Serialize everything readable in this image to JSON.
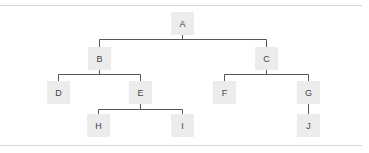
{
  "diagram": {
    "type": "tree",
    "colors": {
      "node_fill": "#ececec",
      "node_text": "#444444",
      "edge": "#555555",
      "separator": "#d8d8d8"
    },
    "nodes": [
      {
        "id": "A",
        "label": "A",
        "x": 171,
        "y": 12
      },
      {
        "id": "B",
        "label": "B",
        "x": 88,
        "y": 47
      },
      {
        "id": "C",
        "label": "C",
        "x": 255,
        "y": 47
      },
      {
        "id": "D",
        "label": "D",
        "x": 47,
        "y": 81
      },
      {
        "id": "E",
        "label": "E",
        "x": 129,
        "y": 81
      },
      {
        "id": "F",
        "label": "F",
        "x": 213,
        "y": 81
      },
      {
        "id": "G",
        "label": "G",
        "x": 297,
        "y": 81
      },
      {
        "id": "H",
        "label": "H",
        "x": 87,
        "y": 114
      },
      {
        "id": "I",
        "label": "I",
        "x": 171,
        "y": 114
      },
      {
        "id": "J",
        "label": "J",
        "x": 297,
        "y": 114
      }
    ],
    "edges": [
      [
        "A",
        "B"
      ],
      [
        "A",
        "C"
      ],
      [
        "B",
        "D"
      ],
      [
        "B",
        "E"
      ],
      [
        "C",
        "F"
      ],
      [
        "C",
        "G"
      ],
      [
        "E",
        "H"
      ],
      [
        "E",
        "I"
      ],
      [
        "G",
        "J"
      ]
    ]
  }
}
